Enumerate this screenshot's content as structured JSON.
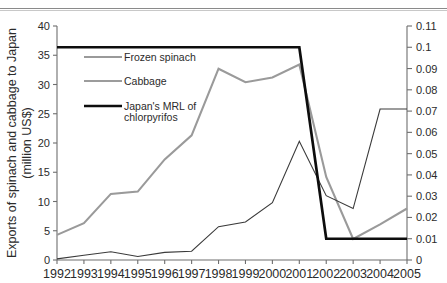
{
  "chart_data": {
    "type": "line",
    "title": "",
    "xlabel": "",
    "ylabel": "Exports of spinach and cabbage to Japan (million US$)",
    "ylabel_line1": "Exports of spinach and cabbage to Japan",
    "ylabel_line2": "(million US$)",
    "y2label": "",
    "grid": false,
    "legend_position": "upper-left-inside",
    "categories": [
      1992,
      1993,
      1994,
      1995,
      1996,
      1997,
      1998,
      1999,
      2000,
      2001,
      2002,
      2003,
      2004,
      2005
    ],
    "x": [
      "1992",
      "1993",
      "1994",
      "1995",
      "1996",
      "1997",
      "1998",
      "1999",
      "2000",
      "2001",
      "2002",
      "2003",
      "2004",
      "2005"
    ],
    "ylim": [
      0,
      40
    ],
    "yticks": [
      0,
      5,
      10,
      15,
      20,
      25,
      30,
      35,
      40
    ],
    "ytick_labels": [
      "0",
      "5",
      "10",
      "15",
      "20",
      "25",
      "30",
      "35",
      "40"
    ],
    "y2lim": [
      0,
      0.11
    ],
    "y2ticks": [
      0,
      0.01,
      0.02,
      0.03,
      0.04,
      0.05,
      0.06,
      0.07,
      0.08,
      0.09,
      0.1,
      0.11
    ],
    "y2tick_labels": [
      "0",
      "0.01",
      "0.02",
      "0.03",
      "0.04",
      "0.05",
      "0.06",
      "0.07",
      "0.08",
      "0.09",
      "0.1",
      "0.11"
    ],
    "series": [
      {
        "name": "Frozen spinach",
        "axis": "left",
        "color": "#9a9a9a",
        "width": 2.1,
        "values": [
          4.3,
          6.3,
          11.3,
          11.7,
          17.2,
          21.3,
          32.7,
          30.4,
          31.2,
          33.4,
          14.2,
          3.6,
          6.1,
          8.8
        ]
      },
      {
        "name": "Cabbage",
        "axis": "left",
        "color": "#3a3a3a",
        "width": 1.1,
        "values": [
          0.2,
          0.8,
          1.4,
          0.6,
          1.3,
          1.5,
          5.7,
          6.5,
          9.8,
          20.3,
          11.0,
          8.8,
          25.8,
          25.8
        ]
      },
      {
        "name": "Japan's MRL of chlorpyrifos",
        "axis": "right",
        "color": "#0d0d0d",
        "width": 2.7,
        "values": [
          0.1,
          0.1,
          0.1,
          0.1,
          0.1,
          0.1,
          0.1,
          0.1,
          0.1,
          0.1,
          0.01,
          0.01,
          0.01,
          0.01
        ]
      }
    ],
    "legend": [
      {
        "label": "Frozen spinach",
        "color": "#9a9a9a",
        "width": 2.1
      },
      {
        "label": "Cabbage",
        "color": "#3a3a3a",
        "width": 1.1
      },
      {
        "label": "Japan's MRL of",
        "label2": "chlorpyrifos",
        "color": "#0d0d0d",
        "width": 2.7
      }
    ]
  }
}
